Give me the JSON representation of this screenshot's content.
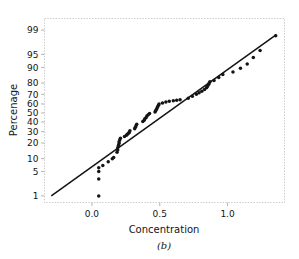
{
  "figure": {
    "caption": "(b)",
    "background": "#ffffff",
    "frame_color": "#c9c9c9",
    "ink_color": "#141414"
  },
  "chart_data": {
    "type": "scatter",
    "title": "",
    "subtitle": "",
    "xlabel": "Concentration",
    "ylabel": "Percenage",
    "grid": false,
    "legend": "none",
    "xlim": [
      -0.35,
      1.42
    ],
    "xticks": [
      0.0,
      0.5,
      1.0
    ],
    "xticklabels": [
      "0.0",
      "0.5",
      "1.0"
    ],
    "y_scale": "normal-probability",
    "ylim": [
      0.6,
      99.6
    ],
    "yticks": [
      1,
      5,
      10,
      20,
      30,
      40,
      50,
      60,
      70,
      80,
      90,
      95,
      99
    ],
    "yticklabels": [
      "1",
      "5",
      "10",
      "20",
      "30",
      "40",
      "50",
      "60",
      "70",
      "80",
      "90",
      "95",
      "99"
    ],
    "reference_line": {
      "label": "fitted normal reference line",
      "x": [
        -0.3,
        1.36
      ],
      "percent": [
        1.0,
        98.6
      ]
    },
    "series": [
      {
        "name": "Concentration sample",
        "marker": "filled-circle",
        "color": "#141414",
        "x": [
          0.05,
          0.05,
          0.05,
          0.05,
          0.08,
          0.12,
          0.15,
          0.16,
          0.185,
          0.19,
          0.19,
          0.195,
          0.2,
          0.2,
          0.205,
          0.21,
          0.24,
          0.255,
          0.26,
          0.27,
          0.275,
          0.28,
          0.315,
          0.32,
          0.325,
          0.33,
          0.375,
          0.385,
          0.39,
          0.4,
          0.405,
          0.415,
          0.425,
          0.465,
          0.47,
          0.475,
          0.48,
          0.485,
          0.49,
          0.495,
          0.52,
          0.545,
          0.57,
          0.6,
          0.625,
          0.65,
          0.71,
          0.74,
          0.77,
          0.79,
          0.81,
          0.83,
          0.845,
          0.85,
          0.855,
          0.86,
          0.865,
          0.87,
          0.9,
          0.935,
          0.965,
          1.04,
          1.095,
          1.145,
          1.19,
          1.24,
          1.355
        ],
        "percent": [
          1.0,
          3.2,
          5.0,
          6.2,
          7.0,
          8.6,
          10.0,
          10.6,
          13.5,
          15.0,
          16.5,
          18.0,
          19.5,
          21.0,
          22.5,
          24.0,
          25.5,
          26.5,
          27.5,
          28.5,
          29.5,
          31.0,
          33.0,
          34.5,
          36.0,
          37.5,
          40.5,
          42.0,
          43.5,
          45.0,
          46.5,
          48.0,
          49.5,
          51.0,
          52.5,
          54.0,
          55.5,
          57.0,
          58.5,
          60.0,
          61.0,
          62.0,
          63.0,
          63.5,
          64.0,
          64.5,
          66.0,
          68.0,
          70.0,
          71.5,
          73.0,
          74.5,
          76.0,
          77.0,
          78.0,
          79.0,
          80.0,
          81.0,
          82.0,
          84.0,
          86.0,
          87.5,
          89.5,
          91.5,
          94.0,
          96.0,
          98.5
        ]
      }
    ]
  }
}
